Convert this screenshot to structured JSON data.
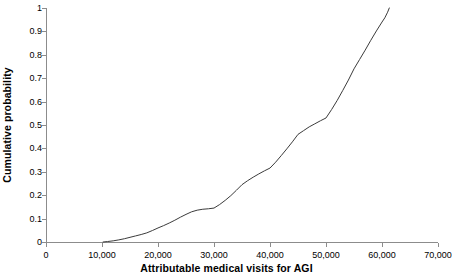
{
  "chart_data": {
    "type": "line",
    "title": "",
    "subtitle": "",
    "xlabel": "Attributable medical visits for AGI",
    "ylabel": "Cumulative probability",
    "xlim": [
      0,
      70000
    ],
    "ylim": [
      0,
      1
    ],
    "grid": false,
    "legend": null,
    "legend_position": "none",
    "x_tick_labels": [
      "0",
      "10,000",
      "20,000",
      "30,000",
      "40,000",
      "50,000",
      "60,000",
      "70,000"
    ],
    "x_tick_values": [
      0,
      10000,
      20000,
      30000,
      40000,
      50000,
      60000,
      70000
    ],
    "y_tick_labels": [
      "0",
      "0.1",
      "0.2",
      "0.3",
      "0.4",
      "0.5",
      "0.6",
      "0.7",
      "0.8",
      "0.9",
      "1"
    ],
    "y_tick_values": [
      0,
      0.1,
      0.2,
      0.3,
      0.4,
      0.5,
      0.6,
      0.7,
      0.8,
      0.9,
      1
    ],
    "series": [
      {
        "name": "Cumulative probability",
        "color": "#3b3b3b",
        "x": [
          10200,
          11000,
          12000,
          13000,
          14000,
          15000,
          16000,
          17000,
          18000,
          19000,
          20000,
          21000,
          22000,
          23000,
          24000,
          25000,
          26000,
          27000,
          28000,
          29000,
          30000,
          31000,
          32000,
          33000,
          34000,
          35000,
          36000,
          37000,
          38000,
          39000,
          40000,
          41000,
          42000,
          43000,
          44000,
          45000,
          46000,
          47000,
          48000,
          49000,
          50000,
          51000,
          52000,
          53000,
          54000,
          55000,
          56000,
          57000,
          58000,
          59000,
          60000,
          60500,
          61000,
          61300
        ],
        "y": [
          0.0,
          0.002,
          0.005,
          0.009,
          0.014,
          0.02,
          0.026,
          0.032,
          0.039,
          0.049,
          0.06,
          0.07,
          0.081,
          0.093,
          0.106,
          0.118,
          0.129,
          0.136,
          0.14,
          0.142,
          0.145,
          0.16,
          0.178,
          0.198,
          0.221,
          0.245,
          0.262,
          0.277,
          0.291,
          0.304,
          0.316,
          0.341,
          0.369,
          0.398,
          0.428,
          0.46,
          0.476,
          0.492,
          0.505,
          0.518,
          0.53,
          0.566,
          0.605,
          0.648,
          0.692,
          0.74,
          0.78,
          0.82,
          0.862,
          0.902,
          0.94,
          0.958,
          0.982,
          1.0
        ]
      }
    ]
  },
  "axes": {
    "x_axis_color": "#8c8c8c",
    "y_axis_color": "#8c8c8c"
  }
}
